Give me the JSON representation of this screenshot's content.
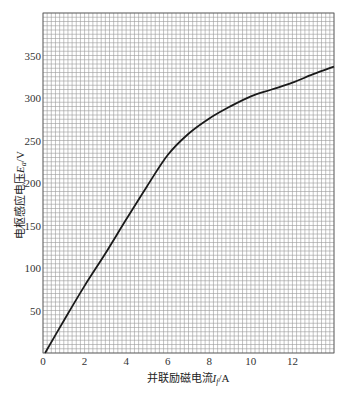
{
  "chart_data": {
    "type": "line",
    "title": "",
    "xlabel": "并联励磁电流I_f/A",
    "ylabel": "电枢感应电压E_a/V",
    "xlabel_parts": {
      "prefix": "并联励磁电流",
      "var": "I",
      "sub": "f",
      "unit": "/A"
    },
    "ylabel_parts": {
      "prefix": "电枢感应电压",
      "var": "E",
      "sub": "a",
      "unit": "/V"
    },
    "xlim": [
      0,
      14
    ],
    "ylim": [
      0,
      400
    ],
    "x_ticks": [
      0,
      2,
      4,
      6,
      8,
      10,
      12
    ],
    "y_ticks": [
      50,
      100,
      150,
      200,
      250,
      300,
      350
    ],
    "x_tick_labels": [
      "0",
      "2",
      "4",
      "6",
      "8",
      "10",
      "12"
    ],
    "y_tick_labels": [
      "50",
      "100",
      "150",
      "200",
      "250",
      "300",
      "350"
    ],
    "grid": true,
    "grid_minor_step": {
      "x": 0.2,
      "y": 5
    },
    "legend": null,
    "series": [
      {
        "name": "magnetization curve",
        "color": "#1a1a1a",
        "x": [
          0.1,
          1,
          2,
          3,
          4,
          5,
          6,
          7,
          8,
          9,
          10,
          11,
          12,
          13,
          14
        ],
        "y": [
          0,
          38,
          79,
          117,
          157,
          196,
          233,
          258,
          276,
          290,
          302,
          310,
          318,
          328,
          337
        ]
      }
    ]
  },
  "colors": {
    "grid_line": "#9a9a9a",
    "grid_border": "#555555",
    "curve": "#1a1a1a"
  }
}
